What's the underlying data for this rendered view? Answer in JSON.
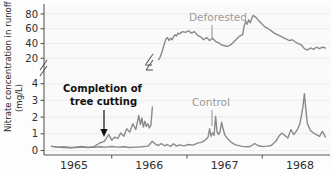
{
  "chart_data": {
    "type": "line",
    "title": "",
    "xlabel": "",
    "ylabel": "Nitrate concentration in runoff (mg/L)",
    "ylabel_line1": "Nitrate concentration in runoff",
    "ylabel_line2": "(mg/L)",
    "grid": true,
    "legend_position": "inline-labels",
    "axis_break": {
      "present": true,
      "between": [
        4,
        20
      ],
      "symbol": "double-slash"
    },
    "y_ticks_lower": [
      0,
      1,
      2,
      3,
      4
    ],
    "y_ticks_upper": [
      20,
      40,
      60,
      80
    ],
    "y_tick_labels": [
      "0",
      "1",
      "2",
      "3",
      "4",
      "20",
      "40",
      "60",
      "80"
    ],
    "ylim_lower": [
      0,
      4.4
    ],
    "ylim_upper": [
      15,
      88
    ],
    "x_tick_labels": [
      "1965",
      "1966",
      "1967",
      "1968"
    ],
    "xlim": [
      "1964.6",
      "1968.4"
    ],
    "colors": {
      "line": "#8a8a8a",
      "label": "#9a9a9a",
      "annotation": "#111111",
      "axis": "#5a5a5a",
      "grid": "#e6e6e6",
      "background": "#fdfdfd"
    },
    "annotations": [
      {
        "name": "completion-of-tree-cutting",
        "text_line1": "Completion of",
        "text_line2": "tree cutting",
        "points_to_year": "1965.45",
        "points_to_value": "0.9"
      }
    ],
    "series": [
      {
        "name": "Deforested",
        "label": "Deforested",
        "label_year": "1966.75",
        "description": "Nitrate concentration in runoff from the deforested watershed; near zero through 1965, rising sharply in early 1966 to 40-60 mg/L, peaking near 80 mg/L in early 1967, then declining to about 35 mg/L by 1968.",
        "points": [
          [
            1964.7,
            0.25
          ],
          [
            1964.78,
            0.2
          ],
          [
            1964.86,
            0.22
          ],
          [
            1964.94,
            0.18
          ],
          [
            1965.02,
            0.2
          ],
          [
            1965.1,
            0.24
          ],
          [
            1965.18,
            0.2
          ],
          [
            1965.26,
            0.22
          ],
          [
            1965.34,
            0.45
          ],
          [
            1965.4,
            0.55
          ],
          [
            1965.46,
            0.95
          ],
          [
            1965.5,
            0.62
          ],
          [
            1965.54,
            0.8
          ],
          [
            1965.58,
            0.72
          ],
          [
            1965.62,
            1.05
          ],
          [
            1965.66,
            0.85
          ],
          [
            1965.7,
            1.3
          ],
          [
            1965.74,
            1.1
          ],
          [
            1965.78,
            1.6
          ],
          [
            1965.82,
            1.25
          ],
          [
            1965.86,
            2.1
          ],
          [
            1965.88,
            1.55
          ],
          [
            1965.9,
            1.95
          ],
          [
            1965.92,
            1.4
          ],
          [
            1965.94,
            1.75
          ],
          [
            1965.96,
            1.45
          ],
          [
            1965.98,
            1.6
          ],
          [
            1966.0,
            1.35
          ],
          [
            1966.02,
            1.5
          ],
          [
            1966.04,
            2.6
          ],
          [
            1966.06,
            5.0
          ],
          [
            1966.08,
            9.0
          ],
          [
            1966.1,
            14.0
          ],
          [
            1966.12,
            18.0
          ],
          [
            1966.14,
            21.0
          ],
          [
            1966.16,
            26.0
          ],
          [
            1966.18,
            33.0
          ],
          [
            1966.2,
            40.0
          ],
          [
            1966.22,
            46.0
          ],
          [
            1966.24,
            48.0
          ],
          [
            1966.26,
            44.0
          ],
          [
            1966.28,
            47.0
          ],
          [
            1966.3,
            45.0
          ],
          [
            1966.32,
            49.0
          ],
          [
            1966.34,
            52.0
          ],
          [
            1966.36,
            50.0
          ],
          [
            1966.38,
            54.0
          ],
          [
            1966.4,
            53.0
          ],
          [
            1966.44,
            56.0
          ],
          [
            1966.48,
            55.0
          ],
          [
            1966.52,
            57.0
          ],
          [
            1966.56,
            54.0
          ],
          [
            1966.6,
            56.0
          ],
          [
            1966.64,
            51.0
          ],
          [
            1966.68,
            49.0
          ],
          [
            1966.72,
            45.0
          ],
          [
            1966.76,
            48.0
          ],
          [
            1966.8,
            44.0
          ],
          [
            1966.84,
            47.0
          ],
          [
            1966.88,
            43.0
          ],
          [
            1966.92,
            41.0
          ],
          [
            1966.96,
            38.0
          ],
          [
            1967.0,
            37.0
          ],
          [
            1967.04,
            36.0
          ],
          [
            1967.08,
            38.0
          ],
          [
            1967.12,
            42.0
          ],
          [
            1967.16,
            46.0
          ],
          [
            1967.2,
            50.0
          ],
          [
            1967.24,
            52.0
          ],
          [
            1967.26,
            64.0
          ],
          [
            1967.28,
            70.0
          ],
          [
            1967.3,
            66.0
          ],
          [
            1967.32,
            72.0
          ],
          [
            1967.34,
            68.0
          ],
          [
            1967.36,
            74.0
          ],
          [
            1967.38,
            78.0
          ],
          [
            1967.42,
            75.0
          ],
          [
            1967.46,
            70.0
          ],
          [
            1967.5,
            66.0
          ],
          [
            1967.54,
            62.0
          ],
          [
            1967.58,
            60.0
          ],
          [
            1967.62,
            57.0
          ],
          [
            1967.66,
            54.0
          ],
          [
            1967.7,
            52.0
          ],
          [
            1967.74,
            50.0
          ],
          [
            1967.78,
            48.0
          ],
          [
            1967.82,
            46.0
          ],
          [
            1967.86,
            44.0
          ],
          [
            1967.9,
            45.0
          ],
          [
            1967.94,
            42.0
          ],
          [
            1967.98,
            40.0
          ],
          [
            1968.02,
            38.0
          ],
          [
            1968.06,
            33.0
          ],
          [
            1968.1,
            31.0
          ],
          [
            1968.14,
            34.0
          ],
          [
            1968.18,
            32.0
          ],
          [
            1968.22,
            35.0
          ],
          [
            1968.26,
            33.0
          ],
          [
            1968.3,
            35.0
          ],
          [
            1968.34,
            34.0
          ]
        ]
      },
      {
        "name": "Control",
        "label": "Control",
        "label_year": "1966.85",
        "description": "Nitrate concentration in runoff from the undisturbed control watershed; remains low throughout, generally below 1 mg/L with occasional spikes to 2-3.4 mg/L.",
        "points": [
          [
            1964.7,
            0.25
          ],
          [
            1964.78,
            0.2
          ],
          [
            1964.86,
            0.18
          ],
          [
            1964.94,
            0.16
          ],
          [
            1965.02,
            0.18
          ],
          [
            1965.1,
            0.2
          ],
          [
            1965.18,
            0.17
          ],
          [
            1965.26,
            0.19
          ],
          [
            1965.34,
            0.22
          ],
          [
            1965.42,
            0.2
          ],
          [
            1965.5,
            0.24
          ],
          [
            1965.58,
            0.2
          ],
          [
            1965.66,
            0.22
          ],
          [
            1965.74,
            0.18
          ],
          [
            1965.82,
            0.2
          ],
          [
            1965.9,
            0.22
          ],
          [
            1965.98,
            0.26
          ],
          [
            1966.04,
            0.55
          ],
          [
            1966.08,
            0.38
          ],
          [
            1966.12,
            0.3
          ],
          [
            1966.16,
            0.42
          ],
          [
            1966.2,
            0.28
          ],
          [
            1966.24,
            0.36
          ],
          [
            1966.28,
            0.24
          ],
          [
            1966.32,
            0.4
          ],
          [
            1966.36,
            0.26
          ],
          [
            1966.4,
            0.34
          ],
          [
            1966.46,
            0.28
          ],
          [
            1966.52,
            0.36
          ],
          [
            1966.58,
            0.32
          ],
          [
            1966.64,
            0.44
          ],
          [
            1966.7,
            0.5
          ],
          [
            1966.74,
            0.62
          ],
          [
            1966.78,
            0.8
          ],
          [
            1966.8,
            1.3
          ],
          [
            1966.82,
            0.85
          ],
          [
            1966.84,
            1.05
          ],
          [
            1966.86,
            0.9
          ],
          [
            1966.88,
            2.05
          ],
          [
            1966.9,
            1.1
          ],
          [
            1966.92,
            0.95
          ],
          [
            1966.94,
            1.15
          ],
          [
            1966.96,
            1.7
          ],
          [
            1966.98,
            1.3
          ],
          [
            1967.0,
            0.95
          ],
          [
            1967.04,
            0.7
          ],
          [
            1967.08,
            0.52
          ],
          [
            1967.12,
            0.4
          ],
          [
            1967.16,
            0.32
          ],
          [
            1967.22,
            0.26
          ],
          [
            1967.28,
            0.22
          ],
          [
            1967.34,
            0.24
          ],
          [
            1967.4,
            0.42
          ],
          [
            1967.44,
            0.3
          ],
          [
            1967.5,
            0.24
          ],
          [
            1967.56,
            0.26
          ],
          [
            1967.62,
            0.3
          ],
          [
            1967.68,
            0.55
          ],
          [
            1967.72,
            0.85
          ],
          [
            1967.76,
            1.05
          ],
          [
            1967.8,
            0.9
          ],
          [
            1967.84,
            0.75
          ],
          [
            1967.88,
            1.25
          ],
          [
            1967.92,
            0.95
          ],
          [
            1967.96,
            1.2
          ],
          [
            1968.0,
            1.6
          ],
          [
            1968.04,
            2.6
          ],
          [
            1968.06,
            3.4
          ],
          [
            1968.08,
            2.4
          ],
          [
            1968.1,
            1.6
          ],
          [
            1968.14,
            1.2
          ],
          [
            1968.18,
            1.05
          ],
          [
            1968.22,
            0.95
          ],
          [
            1968.26,
            0.85
          ],
          [
            1968.3,
            1.15
          ],
          [
            1968.34,
            0.8
          ]
        ]
      }
    ]
  }
}
